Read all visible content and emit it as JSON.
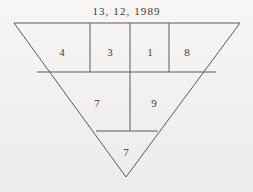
{
  "figure": {
    "title_text": "13, 12, 1989",
    "shape": "inverted-triangle",
    "stroke_color": "#5a5a5a",
    "background_color": "#f4f3f1",
    "text_color": "#3c3c3c",
    "geometry": {
      "top_left": [
        14,
        23
      ],
      "top_right": [
        240,
        23
      ],
      "apex": [
        126,
        177
      ],
      "row1_divider_y": 72,
      "row2_divider_y": 131,
      "vertical_dividers_x": [
        90,
        130,
        169
      ]
    },
    "rows": [
      {
        "name": "row-1",
        "cells": [
          {
            "label": "4",
            "x": 62,
            "y": 52
          },
          {
            "label": "3",
            "x": 110,
            "y": 52
          },
          {
            "label": "1",
            "x": 150,
            "y": 52
          },
          {
            "label": "8",
            "x": 187,
            "y": 52
          }
        ]
      },
      {
        "name": "row-2",
        "cells": [
          {
            "label": "7",
            "x": 97,
            "y": 103
          },
          {
            "label": "9",
            "x": 154,
            "y": 103
          }
        ]
      },
      {
        "name": "row-3",
        "cells": [
          {
            "label": "7",
            "x": 126,
            "y": 152
          }
        ]
      }
    ]
  }
}
